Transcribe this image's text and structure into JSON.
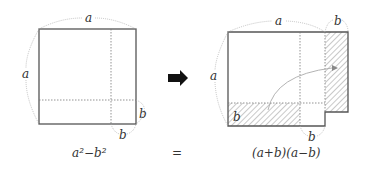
{
  "diagram": {
    "left_figure": {
      "side_label_top": "a",
      "side_label_left": "a",
      "cut_label_right": "b",
      "cut_label_bottom": "b",
      "caption": "a²−b²"
    },
    "transform_arrow": "right-arrow",
    "equals": "=",
    "right_figure": {
      "side_label_top": "a",
      "side_label_extra": "b",
      "side_label_left": "a",
      "strip_label": "b",
      "cut_label_bottom": "b",
      "caption": "(a+b)(a−b)"
    },
    "colors": {
      "line": "#555555",
      "dotted": "#777777",
      "arc": "#aaaaaa",
      "arrow": "#111111"
    }
  }
}
